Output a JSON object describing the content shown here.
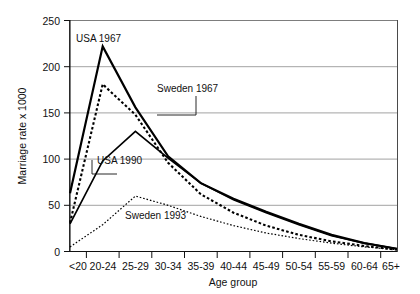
{
  "chart_data": {
    "type": "line",
    "title": "",
    "xlabel": "Age group",
    "ylabel": "Marriage rate x 1000",
    "categories": [
      "<20",
      "20-24",
      "25-29",
      "30-34",
      "35-39",
      "40-44",
      "45-49",
      "50-54",
      "55-59",
      "60-64",
      "65+"
    ],
    "ylim": [
      0,
      250
    ],
    "yticks": [
      0,
      50,
      100,
      150,
      200,
      250
    ],
    "ytick_labels": [
      "0",
      "50",
      "100",
      "150",
      "200",
      "250"
    ],
    "grid": "horizontal",
    "legend_position": "inline-annotations",
    "series": [
      {
        "name": "USA 1967",
        "style": "solid-thick",
        "values": [
          63,
          222,
          156,
          103,
          74,
          57,
          43,
          30,
          18,
          9,
          3
        ]
      },
      {
        "name": "Sweden 1967",
        "style": "dashed-bold",
        "values": [
          31,
          181,
          148,
          96,
          62,
          42,
          28,
          18,
          11,
          6,
          2
        ]
      },
      {
        "name": "USA 1990",
        "style": "solid-thin",
        "values": [
          30,
          98,
          130,
          101,
          74,
          56,
          42,
          29,
          17,
          9,
          3
        ]
      },
      {
        "name": "Sweden 1993",
        "style": "dotted-fine",
        "values": [
          5,
          29,
          60,
          50,
          38,
          28,
          20,
          14,
          9,
          5,
          2
        ]
      }
    ],
    "annotations": [
      {
        "text": "USA 1967",
        "target_category": "20-24"
      },
      {
        "text": "Sweden 1967",
        "target_category": "25-29"
      },
      {
        "text": "USA 1990",
        "target_category": "20-24"
      },
      {
        "text": "Sweden 1993",
        "target_category": "25-29"
      }
    ]
  }
}
